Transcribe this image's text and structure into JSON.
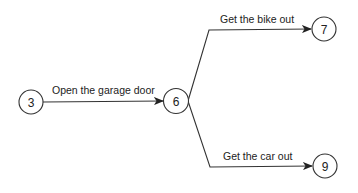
{
  "diagram": {
    "type": "activity-network",
    "nodes": [
      {
        "id": "3",
        "label": "3"
      },
      {
        "id": "6",
        "label": "6"
      },
      {
        "id": "7",
        "label": "7"
      },
      {
        "id": "9",
        "label": "9"
      }
    ],
    "edges": [
      {
        "from": "3",
        "to": "6",
        "label": "Open the garage door"
      },
      {
        "from": "6",
        "to": "7",
        "label": "Get the bike out"
      },
      {
        "from": "6",
        "to": "9",
        "label": "Get the car out"
      }
    ],
    "colors": {
      "stroke": "#333333",
      "text": "#222222",
      "background": "#ffffff"
    }
  }
}
